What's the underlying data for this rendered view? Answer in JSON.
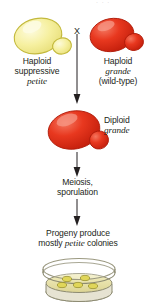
{
  "figure": {
    "background": "#ffffff",
    "text_color": "#231f20",
    "top_partial_text": "· ·      ·"
  },
  "cross": {
    "symbol": "X"
  },
  "parents": {
    "left": {
      "line1": "Haploid",
      "line2": "suppressive",
      "line3": "petite",
      "cell_name": "haploid-suppressive-petite-cell",
      "cell_fill": "#f4ef9a",
      "cell_stroke": "#c6bd3a",
      "cell_highlight": "#fbf8d2"
    },
    "right": {
      "line1": "Haploid",
      "line2": "grande",
      "line3": "(wild-type)",
      "cell_name": "haploid-grande-cell",
      "cell_fill": "#e8321c",
      "cell_stroke": "#b8200d",
      "cell_highlight": "#f4705c"
    }
  },
  "diploid": {
    "line1": "Diploid",
    "line2": "grande",
    "cell_fill": "#e8321c",
    "cell_stroke": "#b8200d",
    "cell_highlight": "#f4705c"
  },
  "meiosis": {
    "line1": "Meiosis,",
    "line2": "sporulation"
  },
  "progeny": {
    "line1": "Progeny produce",
    "line2_pre": "mostly ",
    "line2_em": "petite",
    "line2_post": " colonies"
  },
  "plate": {
    "name": "petri-dish",
    "agar_fill": "#e9e4a8",
    "rim_stroke": "#8d8b72",
    "colony_fill": "#e3da5a",
    "colony_stroke": "#9a9330",
    "colony_count": 5
  },
  "arrows": {
    "color": "#231f20",
    "cross_arrow_label": "cross-to-diploid-arrow",
    "meiosis_arrow_label": "diploid-to-meiosis-arrow",
    "progeny_arrow_label": "meiosis-to-progeny-arrow"
  }
}
